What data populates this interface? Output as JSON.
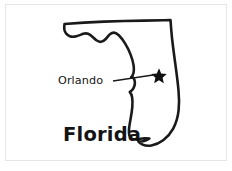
{
  "figure": {
    "kind": "state-outline-map",
    "background_color": "#ffffff",
    "frame_color": "#e6e6e6",
    "ink_color": "#1a1a1a"
  },
  "map": {
    "state_name": "Florida",
    "outline_stroke_color": "#1a1a1a",
    "fill_color": "#ffffff"
  },
  "labels": {
    "state": "Florida",
    "city": "Orlando"
  },
  "markers": [
    {
      "name": "Orlando",
      "symbol": "star",
      "color": "#111111",
      "x": 159,
      "y": 76
    }
  ],
  "annotation": {
    "leader_line_from_x": 113,
    "leader_line_from_y": 81,
    "leader_line_to_x": 153,
    "leader_line_to_y": 75
  }
}
